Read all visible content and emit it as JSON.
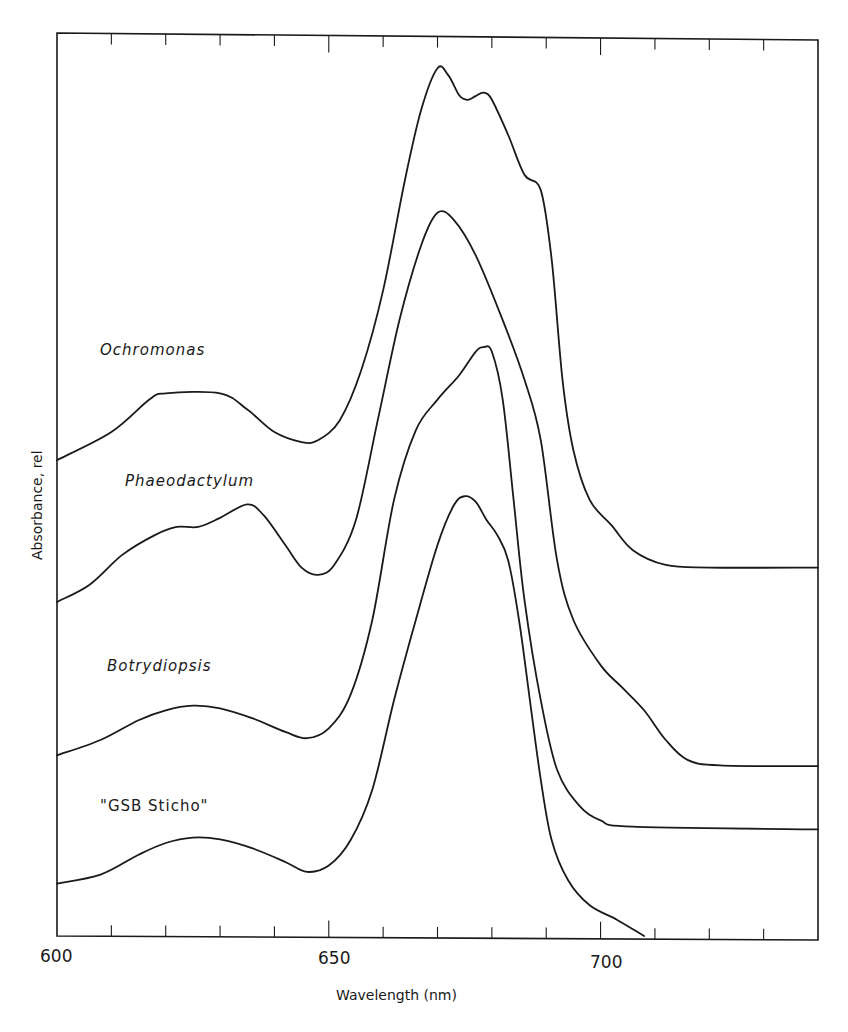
{
  "chart_data": {
    "type": "line",
    "title": "",
    "xlabel": "Wavelength (nm)",
    "ylabel": "Absorbance, rel",
    "xlim": [
      600,
      740
    ],
    "ylim": [
      0,
      1
    ],
    "x_ticks_major": [
      600,
      650,
      700
    ],
    "x_tick_labels": [
      "600",
      "650",
      "700"
    ],
    "x_ticks_minor_step": 10,
    "grid": false,
    "legend": "inline labels",
    "series": [
      {
        "name": "Ochromonas",
        "italic": true,
        "label_pos": [
          100,
          355
        ],
        "points": [
          [
            600,
            0.527
          ],
          [
            610,
            0.558
          ],
          [
            617,
            0.594
          ],
          [
            620,
            0.601
          ],
          [
            630,
            0.601
          ],
          [
            635,
            0.583
          ],
          [
            640,
            0.558
          ],
          [
            645,
            0.547
          ],
          [
            648,
            0.549
          ],
          [
            652,
            0.571
          ],
          [
            656,
            0.627
          ],
          [
            660,
            0.715
          ],
          [
            664,
            0.837
          ],
          [
            667,
            0.915
          ],
          [
            670,
            0.961
          ],
          [
            672,
            0.953
          ],
          [
            674,
            0.931
          ],
          [
            675.5,
            0.926
          ],
          [
            677,
            0.93
          ],
          [
            678.5,
            0.934
          ],
          [
            680,
            0.926
          ],
          [
            683,
            0.887
          ],
          [
            686,
            0.843
          ],
          [
            689,
            0.826
          ],
          [
            691,
            0.749
          ],
          [
            693,
            0.616
          ],
          [
            695,
            0.538
          ],
          [
            698,
            0.483
          ],
          [
            702,
            0.455
          ],
          [
            706,
            0.427
          ],
          [
            712,
            0.411
          ],
          [
            720,
            0.408
          ],
          [
            740,
            0.408
          ]
        ]
      },
      {
        "name": "Phaeodactylum",
        "italic": true,
        "label_pos": [
          125,
          486
        ],
        "points": [
          [
            600,
            0.37
          ],
          [
            606,
            0.389
          ],
          [
            612,
            0.422
          ],
          [
            618,
            0.444
          ],
          [
            622,
            0.453
          ],
          [
            626,
            0.453
          ],
          [
            630,
            0.463
          ],
          [
            635,
            0.478
          ],
          [
            638,
            0.466
          ],
          [
            642,
            0.433
          ],
          [
            645,
            0.408
          ],
          [
            648,
            0.4
          ],
          [
            651,
            0.411
          ],
          [
            655,
            0.461
          ],
          [
            659,
            0.571
          ],
          [
            663,
            0.682
          ],
          [
            667,
            0.765
          ],
          [
            670,
            0.801
          ],
          [
            673,
            0.793
          ],
          [
            677,
            0.754
          ],
          [
            682,
            0.682
          ],
          [
            686,
            0.616
          ],
          [
            689,
            0.549
          ],
          [
            692,
            0.416
          ],
          [
            695,
            0.35
          ],
          [
            700,
            0.3
          ],
          [
            704,
            0.275
          ],
          [
            708,
            0.25
          ],
          [
            712,
            0.217
          ],
          [
            716,
            0.195
          ],
          [
            722,
            0.189
          ],
          [
            740,
            0.188
          ]
        ]
      },
      {
        "name": "Botrydiopsis",
        "italic": true,
        "label_pos": [
          107,
          671
        ],
        "points": [
          [
            600,
            0.2
          ],
          [
            608,
            0.217
          ],
          [
            615,
            0.239
          ],
          [
            620,
            0.25
          ],
          [
            625,
            0.255
          ],
          [
            630,
            0.252
          ],
          [
            636,
            0.241
          ],
          [
            642,
            0.226
          ],
          [
            646,
            0.219
          ],
          [
            650,
            0.23
          ],
          [
            654,
            0.267
          ],
          [
            658,
            0.35
          ],
          [
            662,
            0.483
          ],
          [
            666,
            0.56
          ],
          [
            670,
            0.594
          ],
          [
            674,
            0.621
          ],
          [
            677,
            0.647
          ],
          [
            678.5,
            0.652
          ],
          [
            680,
            0.647
          ],
          [
            682,
            0.594
          ],
          [
            684,
            0.483
          ],
          [
            686,
            0.372
          ],
          [
            689,
            0.261
          ],
          [
            692,
            0.184
          ],
          [
            696,
            0.145
          ],
          [
            700,
            0.128
          ],
          [
            706,
            0.121
          ],
          [
            740,
            0.118
          ]
        ]
      },
      {
        "name": "\"GSB Sticho\"",
        "italic": false,
        "label_pos": [
          100,
          811
        ],
        "points": [
          [
            600,
            0.058
          ],
          [
            608,
            0.068
          ],
          [
            615,
            0.09
          ],
          [
            620,
            0.103
          ],
          [
            625,
            0.109
          ],
          [
            630,
            0.107
          ],
          [
            636,
            0.097
          ],
          [
            642,
            0.082
          ],
          [
            646,
            0.071
          ],
          [
            650,
            0.078
          ],
          [
            654,
            0.106
          ],
          [
            658,
            0.162
          ],
          [
            662,
            0.261
          ],
          [
            666,
            0.35
          ],
          [
            670,
            0.433
          ],
          [
            673,
            0.477
          ],
          [
            675,
            0.487
          ],
          [
            677,
            0.481
          ],
          [
            679,
            0.461
          ],
          [
            681,
            0.444
          ],
          [
            683,
            0.416
          ],
          [
            685,
            0.35
          ],
          [
            687,
            0.261
          ],
          [
            689,
            0.173
          ],
          [
            691,
            0.106
          ],
          [
            694,
            0.062
          ],
          [
            698,
            0.034
          ],
          [
            703,
            0.018
          ],
          [
            708,
            0.0
          ]
        ]
      }
    ]
  },
  "axes": {
    "x_title": "Wavelength (nm)",
    "y_title": "Absorbance, rel",
    "x_labels": [
      {
        "text": "600",
        "x": 40,
        "y": 962
      },
      {
        "text": "650",
        "x": 318,
        "y": 964
      },
      {
        "text": "700",
        "x": 590,
        "y": 968
      }
    ]
  }
}
